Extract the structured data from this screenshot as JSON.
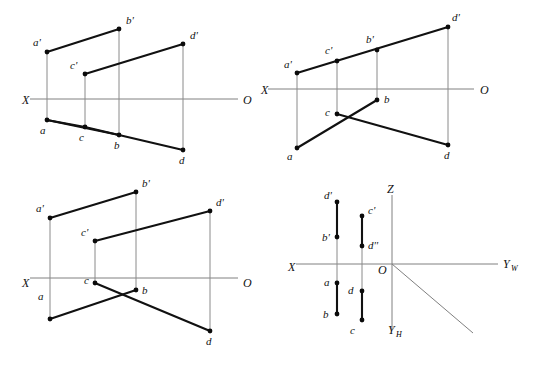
{
  "sheet": {
    "width": 537,
    "height": 365,
    "background": "#ffffff",
    "ink_color": "#111111",
    "axis_color": "#808080",
    "projector_color": "#8a8a8a",
    "figure_count": 4,
    "description": "Four orthographic projection figures of a skew quadrilateral ABCD"
  },
  "figures": [
    {
      "id": "figure-top-left",
      "name": "top-left-projection",
      "axis": {
        "left_label": "X",
        "right_label": "O",
        "left_label_pos": {
          "x": 22,
          "y": 104
        },
        "right_label_pos": {
          "x": 243,
          "y": 104
        },
        "line": {
          "x1": 30,
          "y1": 99,
          "x2": 238,
          "y2": 99
        }
      },
      "vertices": [
        {
          "name": "a'",
          "x": 47,
          "y": 52,
          "label_x": 33,
          "label_y": 46
        },
        {
          "name": "b'",
          "x": 119,
          "y": 29,
          "label_x": 126,
          "label_y": 24
        },
        {
          "name": "c'",
          "x": 85,
          "y": 74,
          "label_x": 70,
          "label_y": 69
        },
        {
          "name": "d'",
          "x": 183,
          "y": 44,
          "label_x": 190,
          "label_y": 39
        },
        {
          "name": "a",
          "x": 47,
          "y": 120,
          "label_x": 40,
          "label_y": 134
        },
        {
          "name": "b",
          "x": 119,
          "y": 135,
          "label_x": 114,
          "label_y": 149
        },
        {
          "name": "c",
          "x": 85,
          "y": 127,
          "label_x": 79,
          "label_y": 141
        },
        {
          "name": "d",
          "x": 183,
          "y": 150,
          "label_x": 179,
          "label_y": 164
        }
      ],
      "object_edges": [
        {
          "from": "a'",
          "to": "b'"
        },
        {
          "from": "c'",
          "to": "d'"
        },
        {
          "from": "a",
          "to": "b"
        },
        {
          "from": "b",
          "to": "d"
        },
        {
          "from": "a",
          "to": "c"
        },
        {
          "from": "c",
          "to": "b"
        }
      ],
      "projectors": [
        {
          "from": "a'",
          "to": "a"
        },
        {
          "from": "b'",
          "to": "b"
        },
        {
          "from": "c'",
          "to": "c"
        },
        {
          "from": "d'",
          "to": "d"
        }
      ]
    },
    {
      "id": "figure-top-right",
      "name": "top-right-projection",
      "axis": {
        "left_label": "X",
        "right_label": "O",
        "left_label_pos": {
          "x": 261,
          "y": 94
        },
        "right_label_pos": {
          "x": 480,
          "y": 94
        },
        "line": {
          "x1": 268,
          "y1": 89,
          "x2": 474,
          "y2": 89
        }
      },
      "vertices": [
        {
          "name": "a'",
          "x": 297,
          "y": 73,
          "label_x": 284,
          "label_y": 68
        },
        {
          "name": "c'",
          "x": 337,
          "y": 61,
          "label_x": 325,
          "label_y": 54
        },
        {
          "name": "b'",
          "x": 377,
          "y": 50,
          "label_x": 366,
          "label_y": 43
        },
        {
          "name": "d'",
          "x": 448,
          "y": 27,
          "label_x": 452,
          "label_y": 21
        },
        {
          "name": "a",
          "x": 297,
          "y": 148,
          "label_x": 287,
          "label_y": 160
        },
        {
          "name": "c",
          "x": 337,
          "y": 114,
          "label_x": 325,
          "label_y": 116
        },
        {
          "name": "b",
          "x": 377,
          "y": 100,
          "label_x": 384,
          "label_y": 103
        },
        {
          "name": "d",
          "x": 448,
          "y": 145,
          "label_x": 444,
          "label_y": 159
        }
      ],
      "object_edges": [
        {
          "from": "a'",
          "to": "d'"
        },
        {
          "from": "a",
          "to": "b"
        },
        {
          "from": "c",
          "to": "d"
        }
      ],
      "projectors": [
        {
          "from": "a'",
          "to": "a"
        },
        {
          "from": "b'",
          "to": "b"
        },
        {
          "from": "c'",
          "to": "c"
        },
        {
          "from": "d'",
          "to": "d"
        }
      ]
    },
    {
      "id": "figure-bottom-left",
      "name": "bottom-left-projection",
      "axis": {
        "left_label": "X",
        "right_label": "O",
        "left_label_pos": {
          "x": 22,
          "y": 287
        },
        "right_label_pos": {
          "x": 243,
          "y": 287
        },
        "line": {
          "x1": 30,
          "y1": 278,
          "x2": 238,
          "y2": 278
        }
      },
      "vertices": [
        {
          "name": "a'",
          "x": 50,
          "y": 218,
          "label_x": 36,
          "label_y": 212
        },
        {
          "name": "b'",
          "x": 136,
          "y": 192,
          "label_x": 142,
          "label_y": 187
        },
        {
          "name": "c'",
          "x": 95,
          "y": 241,
          "label_x": 81,
          "label_y": 236
        },
        {
          "name": "d'",
          "x": 210,
          "y": 211,
          "label_x": 216,
          "label_y": 206
        },
        {
          "name": "a",
          "x": 50,
          "y": 319,
          "label_x": 38,
          "label_y": 300
        },
        {
          "name": "b",
          "x": 136,
          "y": 290,
          "label_x": 142,
          "label_y": 294
        },
        {
          "name": "c",
          "x": 95,
          "y": 283,
          "label_x": 84,
          "label_y": 284
        },
        {
          "name": "d",
          "x": 210,
          "y": 331,
          "label_x": 206,
          "label_y": 345
        }
      ],
      "object_edges": [
        {
          "from": "a'",
          "to": "b'"
        },
        {
          "from": "c'",
          "to": "d'"
        },
        {
          "from": "a",
          "to": "b"
        },
        {
          "from": "c",
          "to": "d"
        }
      ],
      "projectors": [
        {
          "from": "a'",
          "to": "a"
        },
        {
          "from": "b'",
          "to": "b"
        },
        {
          "from": "c'",
          "to": "c"
        },
        {
          "from": "d'",
          "to": "d"
        }
      ]
    },
    {
      "id": "figure-bottom-right",
      "name": "bottom-right-three-axis-projection",
      "axis": {
        "origin_label": "O",
        "origin_label_pos": {
          "x": 378,
          "y": 274
        },
        "origin": {
          "x": 392,
          "y": 264
        },
        "x_label": "X",
        "x_label_pos": {
          "x": 288,
          "y": 271
        },
        "z_label": "Z",
        "z_label_pos": {
          "x": 387,
          "y": 193
        },
        "yw_label": "Y",
        "yw_sub": "W",
        "yw_label_pos": {
          "x": 503,
          "y": 268
        },
        "yh_label": "Y",
        "yh_sub": "H",
        "yh_label_pos": {
          "x": 388,
          "y": 334
        },
        "horizontal_line": {
          "x1": 296,
          "y1": 264,
          "x2": 498,
          "y2": 264
        },
        "vertical_line": {
          "x1": 392,
          "y1": 195,
          "x2": 392,
          "y2": 330
        },
        "diagonal_line": {
          "x1": 392,
          "y1": 264,
          "x2": 473,
          "y2": 333
        }
      },
      "vertices": [
        {
          "name": "d'",
          "x": 337,
          "y": 202,
          "label_x": 324,
          "label_y": 199
        },
        {
          "name": "b'",
          "x": 337,
          "y": 237,
          "label_x": 322,
          "label_y": 241
        },
        {
          "name": "a",
          "x": 337,
          "y": 283,
          "label_x": 324,
          "label_y": 286
        },
        {
          "name": "b",
          "x": 337,
          "y": 314,
          "label_x": 323,
          "label_y": 318
        },
        {
          "name": "c'",
          "x": 362,
          "y": 216,
          "label_x": 368,
          "label_y": 214
        },
        {
          "name": "d''",
          "x": 362,
          "y": 246,
          "label_x": 368,
          "label_y": 249
        },
        {
          "name": "d",
          "x": 362,
          "y": 291,
          "label_x": 348,
          "label_y": 294
        },
        {
          "name": "c",
          "x": 362,
          "y": 320,
          "label_x": 350,
          "label_y": 334
        }
      ],
      "object_edges": [
        {
          "from": "d'",
          "to": "b'"
        },
        {
          "from": "a",
          "to": "b"
        },
        {
          "from": "c'",
          "to": "d''"
        },
        {
          "from": "d",
          "to": "c"
        }
      ],
      "projectors": [
        {
          "from": "b'",
          "to": "a"
        },
        {
          "from": "d''",
          "to": "d"
        }
      ]
    }
  ]
}
